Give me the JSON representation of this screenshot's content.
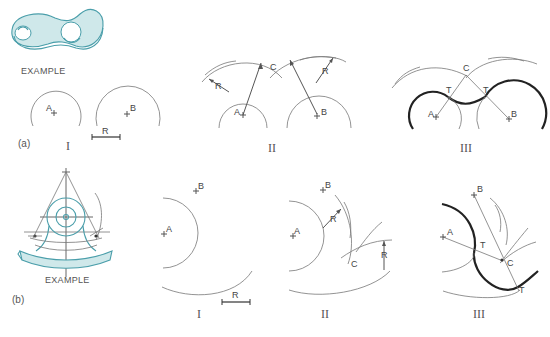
{
  "figure": {
    "part_a": {
      "label": "(a)",
      "example_label": "EXAMPLE",
      "steps": [
        {
          "numeral": "I",
          "points": [
            "A",
            "B"
          ],
          "radius_label": "R"
        },
        {
          "numeral": "II",
          "points": [
            "A",
            "B",
            "C"
          ],
          "radius_labels": [
            "R",
            "R"
          ]
        },
        {
          "numeral": "III",
          "points": [
            "A",
            "B",
            "C",
            "T",
            "T"
          ]
        }
      ]
    },
    "part_b": {
      "label": "(b)",
      "example_label": "EXAMPLE",
      "steps": [
        {
          "numeral": "I",
          "points": [
            "A",
            "B"
          ],
          "radius_label": "R"
        },
        {
          "numeral": "II",
          "points": [
            "A",
            "B",
            "C"
          ],
          "radius_labels": [
            "R",
            "R"
          ]
        },
        {
          "numeral": "III",
          "points": [
            "A",
            "B",
            "C",
            "T",
            "T"
          ]
        }
      ]
    },
    "colors": {
      "accent_teal": "#4a9eaa",
      "teal_fill": "#cfe8ea",
      "line": "#555555",
      "bold_line": "#222222"
    }
  }
}
